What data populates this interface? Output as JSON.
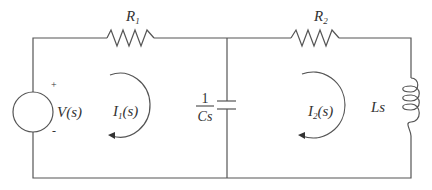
{
  "diagram": {
    "type": "circuit-schematic",
    "components": {
      "voltage_source": {
        "label": "V(s)",
        "plus": "+",
        "minus": "-"
      },
      "resistor_1": {
        "label_main": "R",
        "label_sub": "1"
      },
      "resistor_2": {
        "label_main": "R",
        "label_sub": "2"
      },
      "capacitor": {
        "numerator": "1",
        "denominator": "Cs"
      },
      "inductor": {
        "label": "Ls"
      }
    },
    "mesh_currents": [
      {
        "label_main": "I",
        "label_sub": "1",
        "label_rest": "(s)",
        "direction": "clockwise"
      },
      {
        "label_main": "I",
        "label_sub": "2",
        "label_rest": "(s)",
        "direction": "clockwise"
      }
    ],
    "colors": {
      "wire": "#555555",
      "text": "#333333",
      "background": "#ffffff"
    }
  }
}
